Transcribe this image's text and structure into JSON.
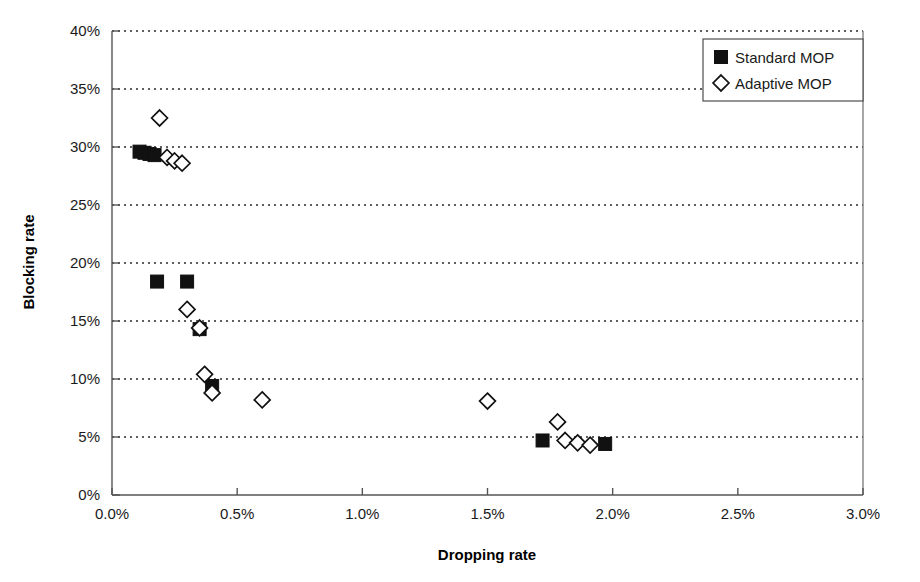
{
  "chart_data": {
    "type": "scatter",
    "title": "",
    "xlabel": "Dropping rate",
    "ylabel": "Blocking rate",
    "xlim": [
      0,
      3.0
    ],
    "ylim": [
      0,
      40
    ],
    "xticks": [
      "0.0%",
      "0.5%",
      "1.0%",
      "1.5%",
      "2.0%",
      "2.5%",
      "3.0%"
    ],
    "xtick_values": [
      0,
      0.5,
      1.0,
      1.5,
      2.0,
      2.5,
      3.0
    ],
    "yticks": [
      "0%",
      "5%",
      "10%",
      "15%",
      "20%",
      "25%",
      "30%",
      "35%",
      "40%"
    ],
    "ytick_values": [
      0,
      5,
      10,
      15,
      20,
      25,
      30,
      35,
      40
    ],
    "grid": "horizontal-dotted",
    "legend_position": "top-right",
    "series": [
      {
        "name": "Standard MOP",
        "marker": "filled-square",
        "color": "#111111",
        "points": [
          {
            "x": 0.11,
            "y": 29.6
          },
          {
            "x": 0.13,
            "y": 29.5
          },
          {
            "x": 0.15,
            "y": 29.4
          },
          {
            "x": 0.17,
            "y": 29.3
          },
          {
            "x": 0.18,
            "y": 18.4
          },
          {
            "x": 0.3,
            "y": 18.4
          },
          {
            "x": 0.35,
            "y": 14.3
          },
          {
            "x": 0.4,
            "y": 9.4
          },
          {
            "x": 1.72,
            "y": 4.7
          },
          {
            "x": 1.97,
            "y": 4.4
          }
        ]
      },
      {
        "name": "Adaptive MOP",
        "marker": "open-diamond",
        "color": "#111111",
        "points": [
          {
            "x": 0.19,
            "y": 32.5
          },
          {
            "x": 0.22,
            "y": 29.1
          },
          {
            "x": 0.25,
            "y": 28.8
          },
          {
            "x": 0.28,
            "y": 28.6
          },
          {
            "x": 0.3,
            "y": 16.0
          },
          {
            "x": 0.35,
            "y": 14.4
          },
          {
            "x": 0.37,
            "y": 10.4
          },
          {
            "x": 0.4,
            "y": 8.8
          },
          {
            "x": 0.6,
            "y": 8.2
          },
          {
            "x": 1.5,
            "y": 8.1
          },
          {
            "x": 1.78,
            "y": 6.3
          },
          {
            "x": 1.81,
            "y": 4.7
          },
          {
            "x": 1.86,
            "y": 4.5
          },
          {
            "x": 1.91,
            "y": 4.3
          }
        ]
      }
    ]
  },
  "legend": {
    "items": [
      {
        "label": "Standard MOP",
        "marker": "filled-square"
      },
      {
        "label": "Adaptive MOP",
        "marker": "open-diamond"
      }
    ]
  }
}
